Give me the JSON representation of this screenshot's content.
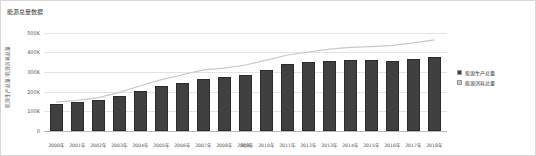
{
  "chart_data": {
    "type": "bar",
    "title": "能源总量数据",
    "xlabel": "时间",
    "ylabel": "能源生产总量/能源消耗总量",
    "ylim": [
      0,
      550000
    ],
    "grid": true,
    "legend_position": "right",
    "y_ticks": [
      {
        "value": 0,
        "label": "0"
      },
      {
        "value": 100000,
        "label": "100K"
      },
      {
        "value": 200000,
        "label": "200K"
      },
      {
        "value": 300000,
        "label": "300K"
      },
      {
        "value": 400000,
        "label": "400K"
      },
      {
        "value": 500000,
        "label": "500K"
      }
    ],
    "categories": [
      "2000年",
      "2001年",
      "2002年",
      "2003年",
      "2004年",
      "2005年",
      "2006年",
      "2007年",
      "2008年",
      "2009年",
      "2010年",
      "2011年",
      "2012年",
      "2013年",
      "2014年",
      "2015年",
      "2016年",
      "2017年",
      "2018年"
    ],
    "series": [
      {
        "name": "能源生产总量",
        "type": "bar",
        "color": "#404040",
        "values": [
          138570,
          147425,
          156277,
          178299,
          206108,
          229037,
          244763,
          264173,
          277419,
          286092,
          312125,
          340178,
          351041,
          358784,
          361866,
          361476,
          355988,
          369000,
          377000
        ]
      },
      {
        "name": "能源消耗总量",
        "type": "line",
        "color": "#c9c9c9",
        "values": [
          146964,
          155547,
          169577,
          197083,
          230281,
          261369,
          286467,
          311442,
          320611,
          336126,
          360648,
          387043,
          402138,
          416913,
          425806,
          429905,
          435819,
          448529,
          464000
        ]
      }
    ]
  }
}
